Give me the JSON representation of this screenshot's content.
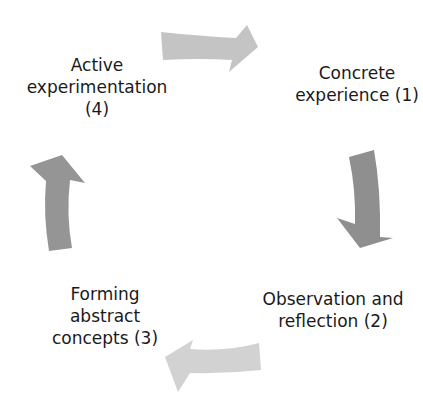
{
  "diagram": {
    "type": "cycle",
    "title": "",
    "arrow_colors": {
      "top": "#c4c4c4",
      "right": "#8f8f8f",
      "bottom": "#d2d2d2",
      "left": "#959595"
    },
    "text_color": "#1a1a1a",
    "stages": [
      {
        "lines": [
          "Concrete",
          "experience (1)"
        ],
        "position": "top-right"
      },
      {
        "lines": [
          "Observation and",
          "reflection (2)"
        ],
        "position": "bottom-right"
      },
      {
        "lines": [
          "Forming",
          "abstract",
          "concepts (3)"
        ],
        "position": "bottom-left"
      },
      {
        "lines": [
          "Active",
          "experimentation",
          "(4)"
        ],
        "position": "top-left"
      }
    ],
    "arrows": [
      {
        "from": "Active experimentation (4)",
        "to": "Concrete experience (1)",
        "direction": "right"
      },
      {
        "from": "Concrete experience (1)",
        "to": "Observation and reflection (2)",
        "direction": "down"
      },
      {
        "from": "Observation and reflection (2)",
        "to": "Forming abstract concepts (3)",
        "direction": "left"
      },
      {
        "from": "Forming abstract concepts (3)",
        "to": "Active experimentation (4)",
        "direction": "up"
      }
    ]
  }
}
